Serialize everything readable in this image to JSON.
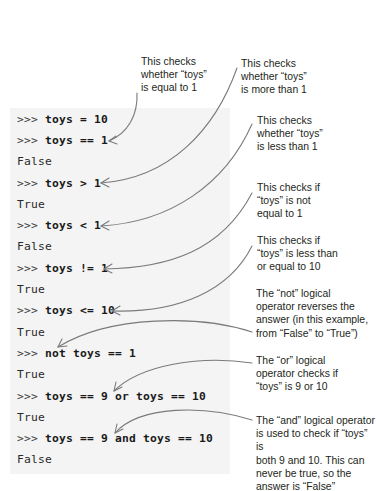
{
  "code": {
    "prompt": ">>>",
    "lines": [
      {
        "type": "input",
        "text": "toys = 10"
      },
      {
        "type": "input",
        "text": "toys == 1"
      },
      {
        "type": "output",
        "text": "False"
      },
      {
        "type": "input",
        "text": "toys > 1"
      },
      {
        "type": "output",
        "text": "True"
      },
      {
        "type": "input",
        "text": "toys < 1"
      },
      {
        "type": "output",
        "text": "False"
      },
      {
        "type": "input",
        "text": "toys != 1"
      },
      {
        "type": "output",
        "text": "True"
      },
      {
        "type": "input",
        "text": "toys <= 10"
      },
      {
        "type": "output",
        "text": "True"
      },
      {
        "type": "input",
        "text": "not toys == 1"
      },
      {
        "type": "output",
        "text": "True"
      },
      {
        "type": "input",
        "text": "toys == 9 or toys == 10"
      },
      {
        "type": "output",
        "text": "True"
      },
      {
        "type": "input",
        "text": "toys == 9 and toys == 10"
      },
      {
        "type": "output",
        "text": "False"
      }
    ]
  },
  "annotations": [
    {
      "id": "equal",
      "lines": [
        "This checks",
        "whether “toys”",
        "is equal to 1"
      ]
    },
    {
      "id": "more",
      "lines": [
        "This checks",
        "whether “toys”",
        "is more than 1"
      ]
    },
    {
      "id": "less",
      "lines": [
        "This checks",
        "whether “toys”",
        "is less than 1"
      ]
    },
    {
      "id": "not-equal",
      "lines": [
        "This checks if",
        "“toys” is not",
        "equal to 1"
      ]
    },
    {
      "id": "less-equal",
      "lines": [
        "This checks if",
        "“toys” is less than",
        "or equal to 10"
      ]
    },
    {
      "id": "not",
      "lines": [
        "The “not” logical",
        "operator reverses the",
        "answer (in this example,",
        "from “False” to “True”)"
      ]
    },
    {
      "id": "or",
      "lines": [
        "The “or” logical",
        "operator checks if",
        "“toys” is 9 or 10"
      ]
    },
    {
      "id": "and",
      "lines": [
        "The “and” logical operator",
        "is used to check if “toys” is",
        "both 9 and 10. This can",
        "never be true, so the",
        "answer is “False”"
      ]
    }
  ],
  "colors": {
    "panel_bg": "#f4f4f4",
    "arrow": "#7a7a7a",
    "text": "#231f20"
  }
}
